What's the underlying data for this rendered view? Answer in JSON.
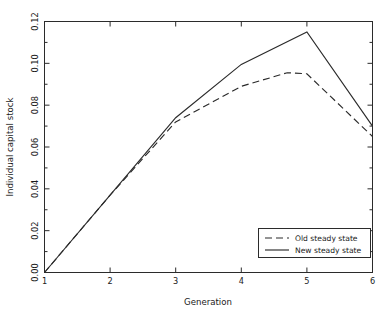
{
  "chart_data": {
    "type": "line",
    "title": "",
    "xlabel": "Generation",
    "ylabel": "Individual capital stock",
    "xlim": [
      1,
      6
    ],
    "ylim": [
      0.0,
      0.12
    ],
    "grid": false,
    "legend_position": "lower right",
    "x_ticks": [
      "1",
      "2",
      "3",
      "4",
      "5",
      "6"
    ],
    "x_tick_values": [
      1,
      2,
      3,
      4,
      5,
      6
    ],
    "y_ticks": [
      "0.00",
      "0.02",
      "0.04",
      "0.06",
      "0.08",
      "0.10",
      "0.12"
    ],
    "y_tick_values": [
      0.0,
      0.02,
      0.04,
      0.06,
      0.08,
      0.1,
      0.12
    ],
    "x": [
      1,
      2,
      3,
      4,
      4.7,
      5,
      6
    ],
    "series": [
      {
        "name": "Old steady state",
        "style": "dashed",
        "color": "#2b2b2b",
        "x": [
          1,
          2,
          3,
          4,
          4.7,
          5,
          6
        ],
        "values": [
          0.0,
          0.037,
          0.072,
          0.089,
          0.0955,
          0.095,
          0.065
        ]
      },
      {
        "name": "New steady state",
        "style": "solid",
        "color": "#2b2b2b",
        "x": [
          1,
          2,
          3,
          4,
          5,
          6
        ],
        "values": [
          0.0,
          0.037,
          0.074,
          0.0995,
          0.115,
          0.07
        ]
      }
    ]
  },
  "legend": {
    "entries": [
      {
        "label": "Old steady state",
        "style": "dashed"
      },
      {
        "label": "New steady state",
        "style": "solid"
      }
    ]
  },
  "axes": {
    "x_title": "Generation",
    "y_title": "Individual capital stock"
  }
}
